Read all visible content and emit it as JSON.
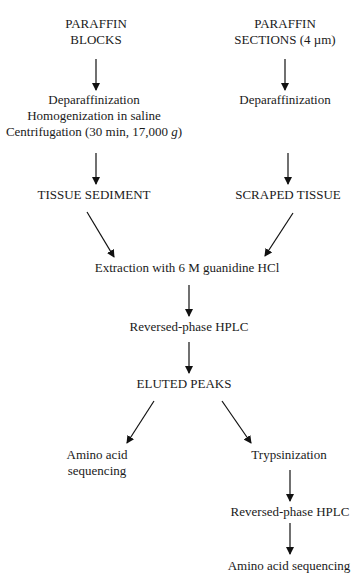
{
  "diagram": {
    "type": "flowchart",
    "nodes": {
      "paraffin_blocks": [
        "PARAFFIN",
        "BLOCKS"
      ],
      "paraffin_sections": [
        "PARAFFIN",
        "SECTIONS (4 µm)"
      ],
      "left_processing": [
        "Deparaffinization",
        "Homogenization in saline",
        "Centrifugation (30 min, 17,000 ",
        "g",
        ")"
      ],
      "right_processing": "Deparaffinization",
      "tissue_sediment": "TISSUE SEDIMENT",
      "scraped_tissue": "SCRAPED TISSUE",
      "extraction": "Extraction with 6 M guanidine HCl",
      "hplc_1": "Reversed-phase HPLC",
      "eluted_peaks": "ELUTED PEAKS",
      "amino_left": [
        "Amino acid",
        "sequencing"
      ],
      "trypsinization": "Trypsinization",
      "hplc_2": "Reversed-phase HPLC",
      "amino_right": "Amino acid sequencing"
    },
    "edges": [
      [
        "paraffin_blocks",
        "left_processing"
      ],
      [
        "paraffin_sections",
        "right_processing"
      ],
      [
        "left_processing",
        "tissue_sediment"
      ],
      [
        "right_processing",
        "scraped_tissue"
      ],
      [
        "tissue_sediment",
        "extraction"
      ],
      [
        "scraped_tissue",
        "extraction"
      ],
      [
        "extraction",
        "hplc_1"
      ],
      [
        "hplc_1",
        "eluted_peaks"
      ],
      [
        "eluted_peaks",
        "amino_left"
      ],
      [
        "eluted_peaks",
        "trypsinization"
      ],
      [
        "trypsinization",
        "hplc_2"
      ],
      [
        "hplc_2",
        "amino_right"
      ]
    ]
  }
}
